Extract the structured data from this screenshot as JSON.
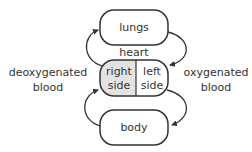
{
  "diagram": {
    "nodes": {
      "lungs": "lungs",
      "heart_title": "heart",
      "heart_right_line1": "right",
      "heart_right_line2": "side",
      "heart_left_line1": "left",
      "heart_left_line2": "side",
      "body": "body"
    },
    "labels": {
      "deoxygenated_line1": "deoxygenated",
      "deoxygenated_line2": "blood",
      "oxygenated_line1": "oxygenated",
      "oxygenated_line2": "blood"
    },
    "colors": {
      "stroke": "#333333",
      "right_side_fill": "#e3e3e3",
      "box_fill": "#ffffff"
    },
    "edges": [
      {
        "from": "heart-right-side",
        "to": "lungs"
      },
      {
        "from": "lungs",
        "to": "heart-left-side"
      },
      {
        "from": "heart-left-side",
        "to": "body"
      },
      {
        "from": "body",
        "to": "heart-right-side"
      }
    ]
  }
}
